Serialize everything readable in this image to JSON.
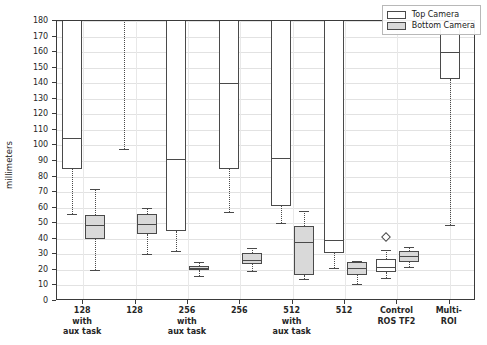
{
  "chart_data": {
    "type": "boxplot",
    "title": "",
    "xlabel": "",
    "ylabel": "millimeters",
    "ylim": [
      0,
      180
    ],
    "ytick_labels": [
      "0",
      "10",
      "20",
      "30",
      "40",
      "50",
      "60",
      "70",
      "80",
      "90",
      "100",
      "110",
      "120",
      "130",
      "140",
      "150",
      "160",
      "170",
      "180"
    ],
    "ytick_values": [
      0,
      10,
      20,
      30,
      40,
      50,
      60,
      70,
      80,
      90,
      100,
      110,
      120,
      130,
      140,
      150,
      160,
      170,
      180
    ],
    "grid": true,
    "legend_position": "upper right",
    "legend": [
      {
        "label": "Top Camera",
        "fill": "#ffffff"
      },
      {
        "label": "Bottom Camera",
        "fill": "#d9d9d9"
      }
    ],
    "categories": [
      "128\nwith\naux task",
      "128",
      "256\nwith\naux task",
      "256",
      "512\nwith\naux task",
      "512",
      "Control\nROS TF2",
      "Multi-ROI"
    ],
    "series": [
      {
        "name": "Top Camera",
        "fill": "#ffffff",
        "boxes": [
          {
            "category": "128 with aux task",
            "whisker_low": 56,
            "q1": 85,
            "median": 105,
            "q3": 205,
            "whisker_high": 215,
            "clipped_top": true,
            "fliers": []
          },
          {
            "category": "128",
            "whisker_low": 98,
            "q1": 185,
            "median": 210,
            "q3": 235,
            "whisker_high": 250,
            "clipped_top": true,
            "fliers": []
          },
          {
            "category": "256 with aux task",
            "whisker_low": 32,
            "q1": 45,
            "median": 91,
            "q3": 200,
            "whisker_high": 215,
            "clipped_top": true,
            "fliers": []
          },
          {
            "category": "256",
            "whisker_low": 57,
            "q1": 85,
            "median": 140,
            "q3": 195,
            "whisker_high": 210,
            "clipped_top": true,
            "fliers": []
          },
          {
            "category": "512 with aux task",
            "whisker_low": 50,
            "q1": 61,
            "median": 92,
            "q3": 200,
            "whisker_high": 215,
            "clipped_top": true,
            "fliers": []
          },
          {
            "category": "512",
            "whisker_low": 21.5,
            "q1": 31,
            "median": 39.5,
            "q3": 195,
            "whisker_high": 210,
            "clipped_top": true,
            "fliers": []
          },
          {
            "category": "Control ROS TF2",
            "whisker_low": 15,
            "q1": 18.5,
            "median": 22,
            "q3": 27,
            "whisker_high": 33,
            "clipped_top": false,
            "fliers": [
              41
            ]
          },
          {
            "category": "Multi-ROI",
            "whisker_low": 49,
            "q1": 143,
            "median": 160,
            "q3": 175,
            "whisker_high": 178,
            "clipped_top": true,
            "fliers": []
          }
        ]
      },
      {
        "name": "Bottom Camera",
        "fill": "#d9d9d9",
        "boxes": [
          {
            "category": "128 with aux task",
            "whisker_low": 20,
            "q1": 40,
            "median": 49,
            "q3": 55,
            "whisker_high": 72,
            "clipped_top": false,
            "fliers": []
          },
          {
            "category": "128",
            "whisker_low": 30,
            "q1": 43,
            "median": 49.5,
            "q3": 56,
            "whisker_high": 60,
            "clipped_top": false,
            "fliers": []
          },
          {
            "category": "256 with aux task",
            "whisker_low": 16,
            "q1": 20,
            "median": 21.5,
            "q3": 22.5,
            "whisker_high": 25,
            "clipped_top": false,
            "fliers": []
          },
          {
            "category": "256",
            "whisker_low": 19,
            "q1": 24,
            "median": 26.5,
            "q3": 31,
            "whisker_high": 34,
            "clipped_top": false,
            "fliers": []
          },
          {
            "category": "512 with aux task",
            "whisker_low": 14,
            "q1": 17,
            "median": 38,
            "q3": 48,
            "whisker_high": 58,
            "clipped_top": false,
            "fliers": []
          },
          {
            "category": "512",
            "whisker_low": 11,
            "q1": 17,
            "median": 21,
            "q3": 25,
            "whisker_high": 26,
            "clipped_top": false,
            "fliers": []
          },
          {
            "category": "Control ROS TF2",
            "whisker_low": 22,
            "q1": 25,
            "median": 29,
            "q3": 32,
            "whisker_high": 35,
            "clipped_top": false,
            "fliers": []
          }
        ]
      }
    ]
  }
}
